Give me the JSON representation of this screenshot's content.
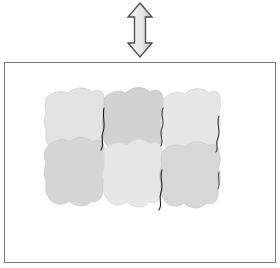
{
  "figure": {
    "title": "",
    "background_color": "#ffffff",
    "width": 280,
    "height": 268
  },
  "arrow": {
    "name": "vertical-double-headed-arrow",
    "direction": "up-down",
    "label": "",
    "fill_color": "#e6e6e6",
    "stroke_color": "#4d4d4d",
    "x": 124,
    "y": 1,
    "width": 32,
    "height": 58
  },
  "frame": {
    "name": "outer-rectangle-frame",
    "label": "",
    "border_color": "#7b7b7b",
    "fill_color": "#ffffff",
    "x": 4,
    "y": 62,
    "width": 272,
    "height": 201
  },
  "tiling": {
    "name": "cell-tiling",
    "rows": 2,
    "columns": 3,
    "crack_color": "#1a1a1a",
    "outline_color": "#d2d2d2",
    "cells": [
      {
        "id": "cell-r1-c1",
        "row": 1,
        "col": 1,
        "shade": "#e3e3e3",
        "label": ""
      },
      {
        "id": "cell-r1-c2",
        "row": 1,
        "col": 2,
        "shade": "#d2d2d2",
        "label": ""
      },
      {
        "id": "cell-r1-c3",
        "row": 1,
        "col": 3,
        "shade": "#e7e7e7",
        "label": ""
      },
      {
        "id": "cell-r2-c1",
        "row": 2,
        "col": 1,
        "shade": "#d6d6d6",
        "label": ""
      },
      {
        "id": "cell-r2-c2",
        "row": 2,
        "col": 2,
        "shade": "#e7e7e7",
        "label": ""
      },
      {
        "id": "cell-r2-c3",
        "row": 2,
        "col": 3,
        "shade": "#d8d8d8",
        "label": ""
      }
    ]
  }
}
